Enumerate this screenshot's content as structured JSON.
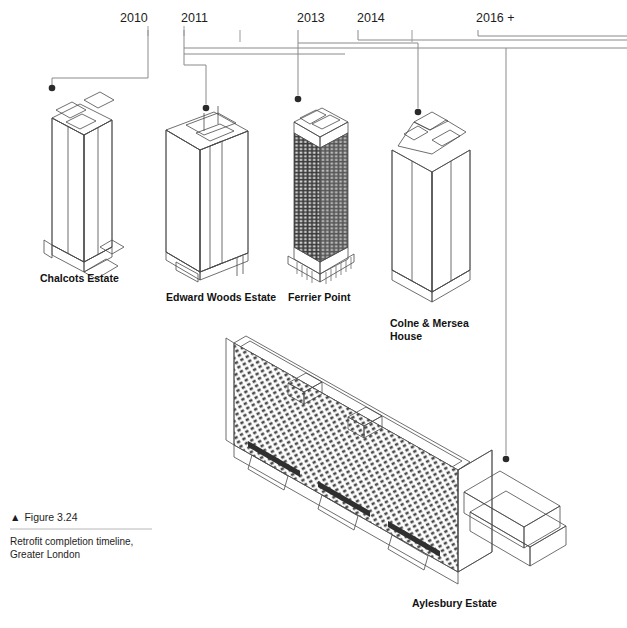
{
  "figure": {
    "marker": "▲",
    "number": "Figure 3.24",
    "caption_line1": "Retrofit completion timeline,",
    "caption_line2": "Greater London"
  },
  "timeline": {
    "ticks": [
      {
        "label": "2010",
        "labeled": true,
        "x": 142
      },
      {
        "label": "2011",
        "labeled": true,
        "x": 203
      },
      {
        "label": "2012",
        "labeled": false,
        "x": 240
      },
      {
        "label": "2013",
        "labeled": true,
        "x": 319
      },
      {
        "label": "2014",
        "labeled": true,
        "x": 375
      },
      {
        "label": "2015",
        "labeled": false,
        "x": 412
      },
      {
        "label": "2016 +",
        "labeled": true,
        "x": 506
      }
    ]
  },
  "buildings": [
    {
      "name": "Chalcots Estate",
      "year": "2010",
      "style": "tower-pale",
      "label_x": 40,
      "label_y": 282
    },
    {
      "name": "Edward Woods Estate",
      "year": "2011",
      "style": "slab-pale",
      "label_x": 166,
      "label_y": 301
    },
    {
      "name": "Ferrier Point",
      "year": "2013",
      "style": "tower-dark",
      "label_x": 288,
      "label_y": 301
    },
    {
      "name": "Colne & Mersea",
      "year": "2014",
      "style": "tower-twin",
      "label_x": 390,
      "label_y": 327
    },
    {
      "name": "House",
      "year": "2014",
      "style": "label-cont",
      "label_x": 390,
      "label_y": 340
    },
    {
      "name": "Aylesbury Estate",
      "year": "2016 +",
      "style": "megaslab",
      "label_x": 412,
      "label_y": 607
    }
  ],
  "colors": {
    "line": "#8a8a8a",
    "dot": "#2a2a2a",
    "text": "#1a1a1a",
    "dark_facade": "#3c3c3c",
    "pale_facade": "#f4f4f4"
  }
}
